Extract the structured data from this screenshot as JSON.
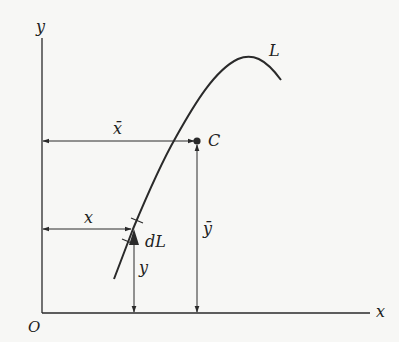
{
  "diagram": {
    "title": "",
    "colors": {
      "ink": "#2a2a2a",
      "background": "#f7f7f5"
    },
    "axes": {
      "x_label": "x",
      "y_label": "y",
      "origin_label": "O"
    },
    "curve": {
      "label": "L"
    },
    "centroid": {
      "label": "C"
    },
    "dimensions": {
      "x_bar": "x̄",
      "y_bar": "ȳ",
      "x": "x",
      "y": "y",
      "element": "dL"
    }
  }
}
